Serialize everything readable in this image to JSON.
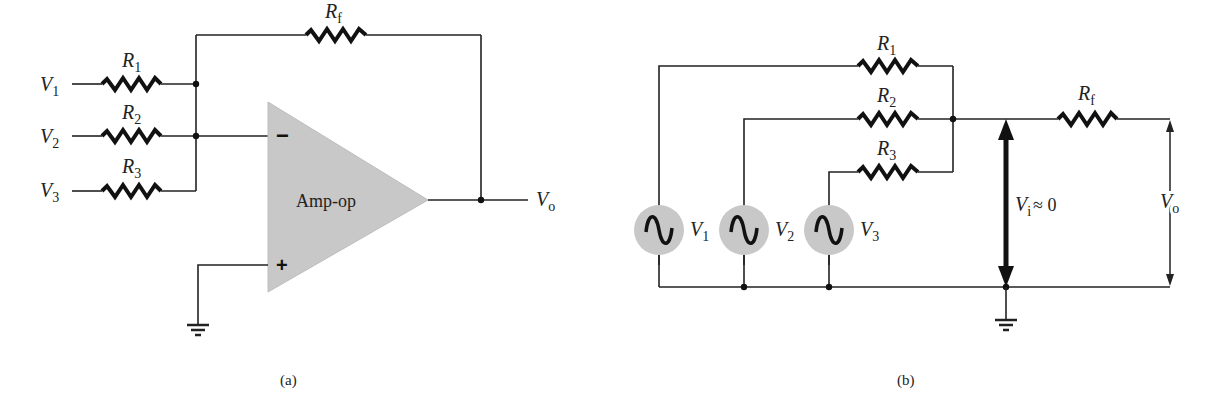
{
  "figure_a": {
    "caption": "(a)",
    "opamp_label": "Amp-op",
    "inverting_sign": "−",
    "noninverting_sign": "+",
    "inputs": [
      {
        "voltage": "V",
        "voltage_sub": "1",
        "resistor": "R",
        "resistor_sub": "1"
      },
      {
        "voltage": "V",
        "voltage_sub": "2",
        "resistor": "R",
        "resistor_sub": "2"
      },
      {
        "voltage": "V",
        "voltage_sub": "3",
        "resistor": "R",
        "resistor_sub": "3"
      }
    ],
    "feedback": {
      "resistor": "R",
      "resistor_sub": "f"
    },
    "output": {
      "voltage": "V",
      "voltage_sub": "o"
    }
  },
  "figure_b": {
    "caption": "(b)",
    "resistors": [
      {
        "name": "R",
        "sub": "1"
      },
      {
        "name": "R",
        "sub": "2"
      },
      {
        "name": "R",
        "sub": "3"
      }
    ],
    "sources": [
      {
        "name": "V",
        "sub": "1"
      },
      {
        "name": "V",
        "sub": "2"
      },
      {
        "name": "V",
        "sub": "3"
      }
    ],
    "feedback": {
      "name": "R",
      "sub": "f"
    },
    "virtual_ground": {
      "name": "V",
      "sub": "i",
      "relation": "≈ 0"
    },
    "output": {
      "name": "V",
      "sub": "o"
    }
  }
}
